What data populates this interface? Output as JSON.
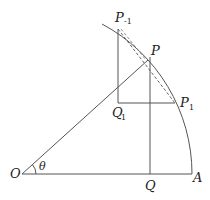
{
  "diagram": {
    "type": "geometry",
    "stroke_color": "#555555",
    "points": {
      "O": {
        "label": "O",
        "sub": ""
      },
      "A": {
        "label": "A",
        "sub": ""
      },
      "P": {
        "label": "P",
        "sub": ""
      },
      "Q": {
        "label": "Q",
        "sub": ""
      },
      "P_minus1": {
        "label": "P",
        "sub": "-1"
      },
      "P_1": {
        "label": "P",
        "sub": "1"
      },
      "Q_1": {
        "label": "Q",
        "sub": "1"
      }
    },
    "angle": {
      "label": "θ"
    },
    "segments": [
      {
        "from": "O",
        "to": "A",
        "style": "solid"
      },
      {
        "from": "O",
        "to": "P",
        "style": "solid"
      },
      {
        "from": "P",
        "to": "Q",
        "style": "solid"
      },
      {
        "from": "P_minus1",
        "to": "Q_1",
        "style": "solid"
      },
      {
        "from": "Q_1",
        "to": "P_1",
        "style": "solid"
      },
      {
        "from": "P_minus1",
        "to": "P_1",
        "style": "dashed"
      }
    ],
    "arc": {
      "center": "O",
      "from": "A",
      "to_beyond": "P_minus1"
    }
  }
}
